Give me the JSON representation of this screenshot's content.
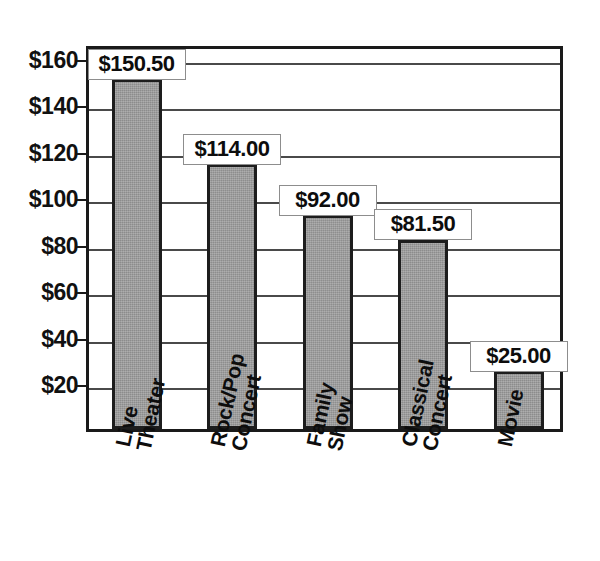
{
  "chart_data": {
    "type": "bar",
    "title": "",
    "subtitle": "",
    "xlabel": "",
    "ylabel": "",
    "categories": [
      "Live Theater",
      "Rock/Pop Concert",
      "Family Show",
      "Classical Concert",
      "Movie"
    ],
    "category_lines": [
      [
        "Live",
        "Theater"
      ],
      [
        "Rock/Pop",
        "Concert"
      ],
      [
        "Family",
        "Show"
      ],
      [
        "Classical",
        "Concert"
      ],
      [
        "Movie"
      ]
    ],
    "values": [
      150.5,
      114.0,
      92.0,
      81.5,
      25.0
    ],
    "data_labels": [
      "$150.50",
      "$114.00",
      "$92.00",
      "$81.50",
      "$25.00"
    ],
    "ylim": [
      0,
      166
    ],
    "ytick_values": [
      20,
      40,
      60,
      80,
      100,
      120,
      140,
      160
    ],
    "ytick_labels": [
      "$20",
      "$40",
      "$60",
      "$80",
      "$100",
      "$120",
      "$140",
      "$160"
    ],
    "gridline_values": [
      20,
      40,
      60,
      80,
      100,
      120,
      140,
      160
    ],
    "grid": true,
    "legend": false,
    "legend_position": "none",
    "bar_color": "#9b9b9b",
    "bar_border_color": "#1d1d1d",
    "axis_color": "#1a1a1a",
    "grid_color": "#4a4a4a",
    "label_box_border_color": "#8d8d8d",
    "label_box_fill": "#ffffff",
    "background_color": "#ffffff",
    "category_label_rotation_deg": -78
  }
}
